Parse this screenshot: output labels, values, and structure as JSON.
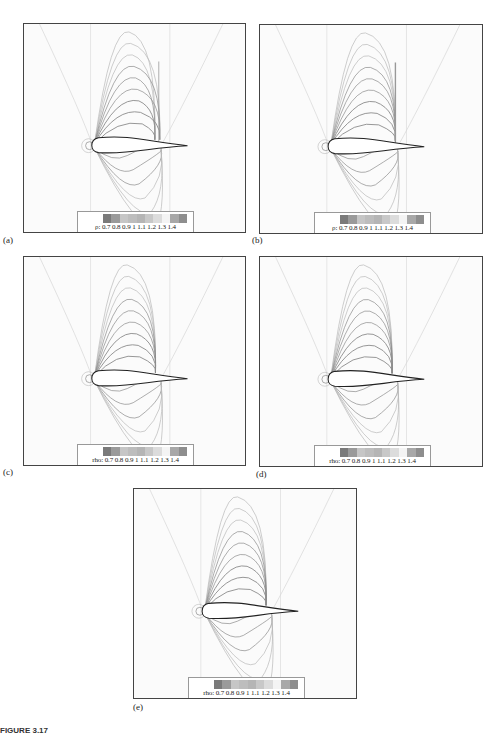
{
  "figure": {
    "caption": "FIGURE 3.17",
    "colorbar_colors": [
      "#7a7a7a",
      "#9a9a9a",
      "#c6c6c6",
      "#bdbdbd",
      "#b5b5b5",
      "#c8c8c8",
      "#dcdcdc",
      "#f4f4f4",
      "#a8a8a8",
      "#8e8e8e"
    ],
    "panels": [
      {
        "id": "a",
        "label": "(a)",
        "legend_var": "ρ:",
        "legend_ticks": "0.7 0.8 0.9  1  1.1 1.2 1.3 1.4",
        "variant": "shock-irregular"
      },
      {
        "id": "b",
        "label": "(b)",
        "legend_var": "ρ:",
        "legend_ticks": "0.7 0.8 0.9  1  1.1 1.2 1.3 1.4",
        "variant": "shock-sharp"
      },
      {
        "id": "c",
        "label": "(c)",
        "legend_var": "rho:",
        "legend_ticks": "0.7 0.8 0.9  1  1.1 1.2 1.3 1.4",
        "variant": "smooth"
      },
      {
        "id": "d",
        "label": "(d)",
        "legend_var": "rho:",
        "legend_ticks": "0.7 0.8 0.9  1  1.1 1.2 1.3 1.4",
        "variant": "smooth"
      },
      {
        "id": "e",
        "label": "(e)",
        "legend_var": "rho:",
        "legend_ticks": "0.7 0.8 0.9  1  1.1 1.2 1.3 1.4",
        "variant": "smooth"
      }
    ]
  },
  "chart_data": {
    "type": "heatmap",
    "colorbar": {
      "variable": [
        "ρ",
        "rho"
      ],
      "ticks": [
        0.7,
        0.8,
        0.9,
        1,
        1.1,
        1.2,
        1.3,
        1.4
      ],
      "range": [
        0.7,
        1.4
      ]
    },
    "panels": [
      "(a)",
      "(b)",
      "(c)",
      "(d)",
      "(e)"
    ]
  }
}
